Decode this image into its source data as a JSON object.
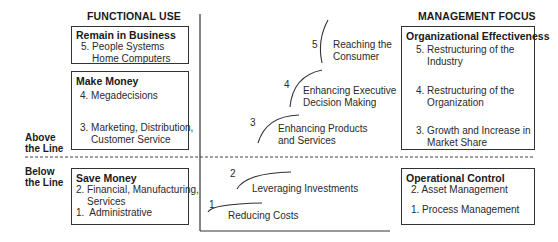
{
  "headings": {
    "left": "FUNCTIONAL USE",
    "right": "MANAGEMENT FOCUS"
  },
  "divider": {
    "above": "Above\nthe Line",
    "below": "Below\nthe Line"
  },
  "functional_use": [
    {
      "title": "Remain in Business",
      "items": [
        "5. People Systems\n    Home Computers"
      ]
    },
    {
      "title": "Make Money",
      "items": [
        "4. Megadecisions",
        "3. Marketing, Distribution,\n    Customer Service"
      ]
    },
    {
      "title": "Save Money",
      "items": [
        "2. Financial, Manufacturing,\n    Services",
        "1.  Administrative"
      ]
    }
  ],
  "stages": [
    {
      "number": "5",
      "label": "Reaching the\nConsumer"
    },
    {
      "number": "4",
      "label": "Enhancing Executive\nDecision Making"
    },
    {
      "number": "3",
      "label": "Enhancing Products\nand Services"
    },
    {
      "number": "2",
      "label": "Leveraging Investments"
    },
    {
      "number": "1",
      "label": "Reducing Costs"
    }
  ],
  "management_focus": [
    {
      "title": "Organizational Effectiveness",
      "items": [
        "5. Restructuring of the\n    Industry",
        "4. Restructuring of the\n    Organization",
        "3. Growth and Increase in\n    Market Share"
      ]
    },
    {
      "title": "Operational Control",
      "items": [
        "2. Asset Management",
        "1. Process Management"
      ]
    }
  ],
  "colors": {
    "line": "#333333",
    "text": "#222222"
  }
}
